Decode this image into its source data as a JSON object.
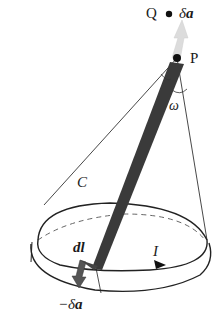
{
  "diagram": {
    "labels": {
      "point_q": "Q",
      "delta_a_top": "δa",
      "delta_a_top_prefix": "δ",
      "delta_a_top_vec": "a",
      "point_p": "P",
      "angle": "ω",
      "curve": "C",
      "line_element_d": "d",
      "line_element_l": "l",
      "current": "I",
      "delta_a_bottom_prefix": "−δ",
      "delta_a_bottom_vec": "a"
    },
    "colors": {
      "line": "#222222",
      "thick_arrow": "#3a3a3a",
      "faint_arrow": "#d8d8d8",
      "dashed": "#666666"
    }
  }
}
